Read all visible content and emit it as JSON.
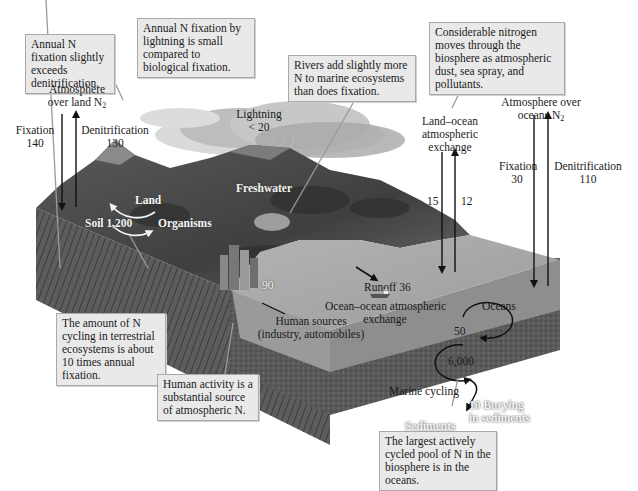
{
  "figure": {
    "units_note": "",
    "callouts": [
      {
        "id": "fixation-exceeds",
        "text": "Annual N fixation slightly exceeds denitrification."
      },
      {
        "id": "lightning-small",
        "text": "Annual N fixation by lightning is small compared to biological fixation."
      },
      {
        "id": "rivers-add",
        "text": "Rivers add slightly more N to marine ecosystems than does fixation."
      },
      {
        "id": "atmospheric-moves",
        "text": "Considerable nitrogen moves through the biosphere as atmospheric dust, sea spray, and pollutants."
      },
      {
        "id": "terrestrial-cycling",
        "text": "The amount of N cycling in terrestrial ecosystems is about 10 times annual fixation."
      },
      {
        "id": "human-activity",
        "text": "Human activity is a substantial source of atmospheric N."
      },
      {
        "id": "largest-pool",
        "text": "The largest actively cycled pool of N in the biosphere is in the oceans."
      }
    ],
    "labels": {
      "atm_land_line1": "Atmosphere",
      "atm_land_line2": "over land N",
      "atm_land_sub": "2",
      "fixation_land_label": "Fixation",
      "fixation_land_value": "140",
      "denit_land_label": "Denitrification",
      "denit_land_value": "130",
      "lightning_label": "Lightning",
      "lightning_value": "< 20",
      "land_ocean_line1": "Land–ocean",
      "land_ocean_line2": "atmospheric",
      "land_ocean_line3": "exchange",
      "land_to_ocean_value": "15",
      "ocean_to_land_value": "12",
      "atm_ocean_line1": "Atmosphere over",
      "atm_ocean_line2": "oceans N",
      "atm_ocean_sub": "2",
      "fixation_ocean_label": "Fixation",
      "fixation_ocean_value": "30",
      "denit_ocean_label": "Denitrification",
      "denit_ocean_value": "110",
      "land": "Land",
      "soil": "Soil 1,200",
      "organisms": "Organisms",
      "freshwater": "Freshwater",
      "runoff": "Runoff 36",
      "ocean_ocean_line1": "Ocean–ocean atmospheric",
      "ocean_ocean_line2": "exchange",
      "oceans": "Oceans",
      "human_value": "90",
      "human_sources_line1": "Human sources",
      "human_sources_line2": "(industry, automobiles)",
      "marine_upper_pool": "50",
      "marine_lower_pool": "6,000",
      "marine_cycling": "Marine cycling",
      "burying_line1": "10  Burying",
      "burying_line2": "in sediments",
      "sediments": "Sediments"
    },
    "fluxes": [
      {
        "name": "Fixation (land)",
        "value": 140,
        "direction": "atmosphere→land"
      },
      {
        "name": "Denitrification (land)",
        "value": 130,
        "direction": "land→atmosphere"
      },
      {
        "name": "Lightning",
        "value": "< 20",
        "direction": "atmosphere→land"
      },
      {
        "name": "Land–ocean atmospheric exchange (down)",
        "value": 15,
        "direction": "atmosphere→ocean"
      },
      {
        "name": "Land–ocean atmospheric exchange (up)",
        "value": 12,
        "direction": "ocean→atmosphere"
      },
      {
        "name": "Fixation (ocean)",
        "value": 30,
        "direction": "atmosphere→ocean"
      },
      {
        "name": "Denitrification (ocean)",
        "value": 110,
        "direction": "ocean→atmosphere"
      },
      {
        "name": "Runoff",
        "value": 36,
        "direction": "land→ocean"
      },
      {
        "name": "Human sources",
        "value": 90,
        "direction": "human→atmosphere"
      },
      {
        "name": "Ocean–ocean atmospheric exchange",
        "value": 50,
        "direction": "cycle"
      },
      {
        "name": "Marine cycling",
        "value": 6000,
        "direction": "cycle"
      },
      {
        "name": "Burying in sediments",
        "value": 10,
        "direction": "ocean→sediments"
      }
    ],
    "pools": [
      {
        "name": "Soil / land organisms",
        "value": 1200
      },
      {
        "name": "Ocean atmospheric exchange pool",
        "value": 50
      },
      {
        "name": "Marine cycling pool",
        "value": 6000
      }
    ],
    "colors": {
      "callout_bg": "#e9e9e9",
      "callout_border": "#a9a9a9",
      "ocean_top": "#a6a6a6",
      "ocean_side": "#8f8f8f",
      "sediment": "#5e5e5e",
      "land": "#4d4d4d",
      "arrow": "#111111"
    }
  }
}
